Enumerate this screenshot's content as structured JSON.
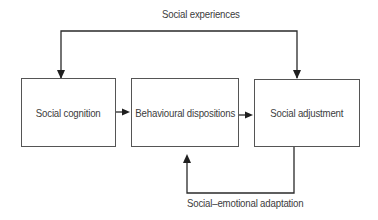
{
  "diagram": {
    "nodes": [
      {
        "id": "social-cognition",
        "label": "Social cognition"
      },
      {
        "id": "behavioural-dispositions",
        "label": "Behavioural dispositions"
      },
      {
        "id": "social-adjustment",
        "label": "Social adjustment"
      }
    ],
    "edges": [
      {
        "from": "social-cognition",
        "to": "behavioural-dispositions",
        "label": ""
      },
      {
        "from": "behavioural-dispositions",
        "to": "social-adjustment",
        "label": ""
      },
      {
        "from": "social-experiences",
        "to": "social-cognition",
        "label": "Social experiences"
      },
      {
        "from": "social-experiences",
        "to": "social-adjustment",
        "label": "Social experiences"
      },
      {
        "from": "social-adjustment",
        "to": "behavioural-dispositions",
        "label": "Social–emotional adaptation"
      }
    ],
    "labels": {
      "top_loop": "Social experiences",
      "bottom_loop": "Social–emotional adaptation"
    },
    "colors": {
      "line": "#2a2a2a",
      "box_border": "#555555",
      "text": "#3c3c3c"
    }
  }
}
